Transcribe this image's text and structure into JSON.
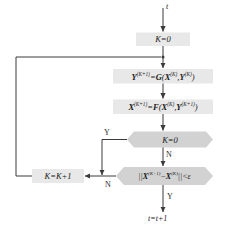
{
  "diagram": {
    "colors": {
      "process_fill": "#e8e8e8",
      "decision_fill": "#d2d2d2",
      "stroke": "#8a8a8a",
      "line": "#4d4d4d",
      "text": "#1a1a1a"
    },
    "terminals": {
      "input": "t",
      "output": "t=t+1"
    },
    "nodes": [
      {
        "id": "init",
        "shape": "process",
        "label": "K=0"
      },
      {
        "id": "compute_y",
        "shape": "process",
        "label": "Y(K+1)=G(X(K),Y(K))"
      },
      {
        "id": "compute_x",
        "shape": "process",
        "label": "X(K+1)=F(X(K),Y(K+1))"
      },
      {
        "id": "check_k",
        "shape": "decision",
        "label": "K=0"
      },
      {
        "id": "check_eps",
        "shape": "decision",
        "label": "||X(K+1)-X(K)||<ε"
      },
      {
        "id": "increment",
        "shape": "process",
        "label": "K=K+1"
      }
    ],
    "edge_labels": {
      "k_zero_yes": "Y",
      "k_zero_no": "N",
      "eps_no": "N",
      "eps_yes": "Y"
    }
  }
}
